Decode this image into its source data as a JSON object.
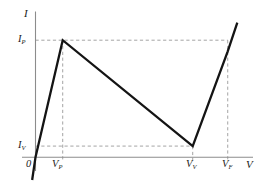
{
  "figure": {
    "background_color": "#ffffff",
    "curve_color": "#141414",
    "axis_color": "#8c8c8c",
    "dash_color": "#9a9a9a"
  },
  "axes": {
    "y_label": "I",
    "x_label": "V",
    "origin_label": "0"
  },
  "ticks": {
    "y": [
      {
        "id": "peak-current",
        "base": "I",
        "sub": "P"
      },
      {
        "id": "valley-current",
        "base": "I",
        "sub": "V"
      }
    ],
    "x": [
      {
        "id": "peak-voltage",
        "base": "V",
        "sub": "P"
      },
      {
        "id": "valley-voltage",
        "base": "V",
        "sub": "V"
      },
      {
        "id": "forward-voltage",
        "base": "V",
        "sub": "F"
      }
    ]
  },
  "chart_data": {
    "type": "line",
    "xlabel": "V",
    "ylabel": "I",
    "grid": false,
    "legend": null,
    "xlim": [
      -0.12,
      1.15
    ],
    "ylim": [
      -0.18,
      1.25
    ],
    "annotations": [
      {
        "text": "0",
        "role": "origin"
      },
      {
        "text": "I_P",
        "role": "y-tick",
        "value": 1.0
      },
      {
        "text": "I_V",
        "role": "y-tick",
        "value": 0.095
      },
      {
        "text": "V_P",
        "role": "x-tick",
        "value": 0.122
      },
      {
        "text": "V_V",
        "role": "x-tick",
        "value": 0.705
      },
      {
        "text": "V_F",
        "role": "x-tick",
        "value": 0.862
      }
    ],
    "series": [
      {
        "name": "tunnel-diode-curve",
        "x": [
          -0.015,
          0.0,
          0.122,
          0.705,
          0.862,
          0.905
        ],
        "y": [
          -0.195,
          0.0,
          1.0,
          0.095,
          0.905,
          1.15
        ]
      }
    ],
    "guides": [
      {
        "type": "hline",
        "label": "I_P",
        "y": 1.0,
        "x_from": 0.0,
        "x_to": 0.862
      },
      {
        "type": "hline",
        "label": "I_V",
        "y": 0.095,
        "x_from": 0.0,
        "x_to": 0.705
      },
      {
        "type": "vline",
        "label": "V_P",
        "x": 0.122,
        "y_from": 0.0,
        "y_to": 1.0
      },
      {
        "type": "vline",
        "label": "V_V",
        "x": 0.705,
        "y_from": 0.0,
        "y_to": 0.095
      },
      {
        "type": "vline",
        "label": "V_F",
        "x": 0.862,
        "y_from": 0.0,
        "y_to": 1.0
      }
    ]
  }
}
